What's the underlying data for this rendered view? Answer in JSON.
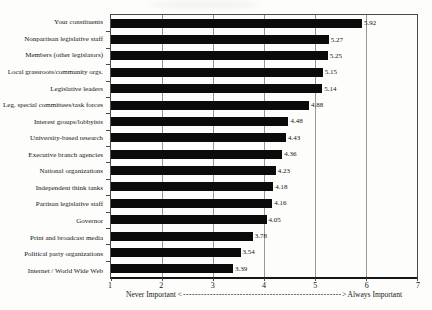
{
  "figure": {
    "background": "#fdfdfb",
    "bar_color": "#0b0b0b",
    "grid_color": "#979795",
    "axis_color": "#4a4a4a"
  },
  "xaxis": {
    "legend_left": "Never Important <",
    "legend_dashes": "------------------------------------------------------------------------------------------------------------------------",
    "legend_right": "> Always Important"
  },
  "chart_data": {
    "type": "bar",
    "orientation": "horizontal",
    "title": "",
    "xlabel": "Never Important <-> Always Important",
    "ylabel": "",
    "xlim": [
      1,
      7
    ],
    "xticks": [
      "1",
      "2",
      "3",
      "4",
      "5",
      "6",
      "7"
    ],
    "gridlines_at": [
      2,
      3,
      4,
      5,
      6
    ],
    "legend_position": "none",
    "categories": [
      "Your constituents",
      "Nonpartisan legislative staff",
      "Members (other legislators)",
      "Local grassroots/community orgs.",
      "Legislative leaders",
      "Leg. special committees/task forces",
      "Interest groups/lobbyists",
      "University-based research",
      "Executive branch agencies",
      "National organizations",
      "Independent think tanks",
      "Partisan legislative staff",
      "Governor",
      "Print and broadcast media",
      "Political party organizations",
      "Internet / World Wide Web"
    ],
    "values": [
      5.92,
      5.27,
      5.25,
      5.15,
      5.14,
      4.88,
      4.48,
      4.43,
      4.36,
      4.23,
      4.18,
      4.16,
      4.05,
      3.78,
      3.54,
      3.39
    ],
    "value_labels": [
      "5.92",
      "5.27",
      "5.25",
      "5.15",
      "5.14",
      "4.88",
      "4.48",
      "4.43",
      "4.36",
      "4.23",
      "4.18",
      "4.16",
      "4.05",
      "3.78",
      "3.54",
      "3.39"
    ]
  }
}
